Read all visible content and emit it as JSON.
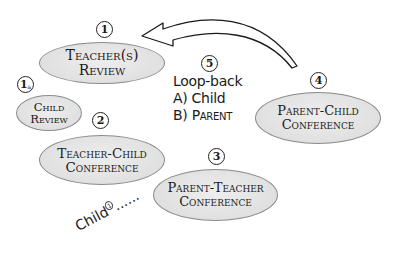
{
  "diagram": {
    "nodes": [
      {
        "id": "1",
        "marker": "1",
        "lines": [
          "Teacher(s)",
          "Review"
        ]
      },
      {
        "id": "1a",
        "marker": "1",
        "marker_sub": "a",
        "lines": [
          "Child",
          "Review"
        ]
      },
      {
        "id": "2",
        "marker": "2",
        "lines": [
          "Teacher-Child",
          "Conference"
        ]
      },
      {
        "id": "3",
        "marker": "3",
        "lines": [
          "Parent-Teacher",
          "Conference"
        ]
      },
      {
        "id": "4",
        "marker": "4",
        "lines": [
          "Parent-Child",
          "Conference"
        ]
      }
    ],
    "loopback": {
      "marker": "5",
      "title": "Loop-back",
      "option_a": "A) Child",
      "option_b_prefix": "B) ",
      "option_b": "Parent"
    },
    "arrow": {
      "from": "4",
      "to": "1",
      "style": "curved-hollow"
    },
    "footnote": {
      "text": "Child",
      "marker": "1",
      "trail": "......"
    }
  },
  "colors": {
    "ellipse_fill": "#e2e2e2",
    "ellipse_border": "#8a8a8a",
    "text": "#1a1a1a",
    "background": "#ffffff"
  }
}
